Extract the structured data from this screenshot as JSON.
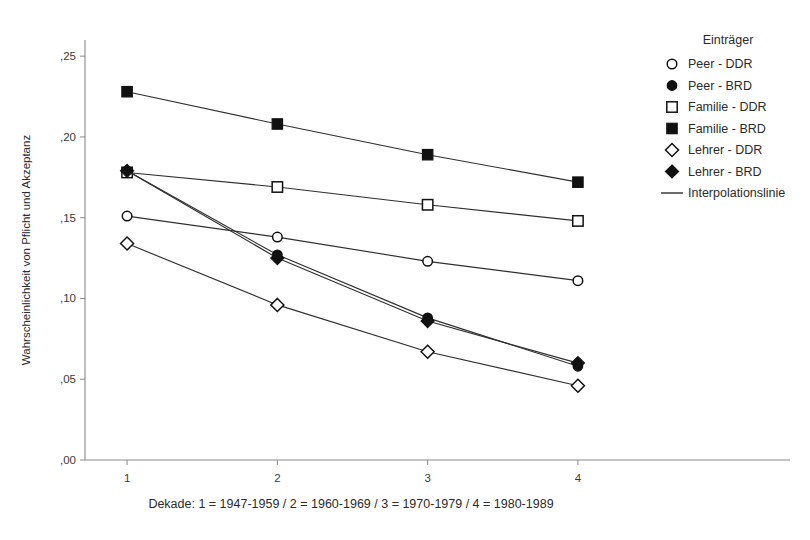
{
  "chart_data": {
    "type": "line",
    "title": "",
    "xlabel": "Dekade: 1 = 1947-1959 / 2 = 1960-1969 / 3 = 1970-1979 / 4 = 1980-1989",
    "ylabel": "Wahrscheinlichkeit von Pflicht und Akzeptanz",
    "x": [
      1,
      2,
      3,
      4
    ],
    "xtick_labels": [
      "1",
      "2",
      "3",
      "4"
    ],
    "ytick_labels": [
      ",00",
      ",05",
      ",10",
      ",15",
      ",20",
      ",25"
    ],
    "ytick_values": [
      0.0,
      0.05,
      0.1,
      0.15,
      0.2,
      0.25
    ],
    "ylim": [
      0.0,
      0.26
    ],
    "xlim": [
      0.72,
      4.28
    ],
    "grid": false,
    "legend_position": "right",
    "legend_title": "Einträger",
    "series": [
      {
        "name": "Peer - DDR",
        "marker": "circle-open",
        "values": [
          0.151,
          0.138,
          0.123,
          0.111
        ]
      },
      {
        "name": "Peer - BRD",
        "marker": "circle-filled",
        "values": [
          0.179,
          0.127,
          0.088,
          0.058
        ]
      },
      {
        "name": "Familie - DDR",
        "marker": "square-open",
        "values": [
          0.178,
          0.169,
          0.158,
          0.148
        ]
      },
      {
        "name": "Familie - BRD",
        "marker": "square-filled",
        "values": [
          0.228,
          0.208,
          0.189,
          0.172
        ]
      },
      {
        "name": "Lehrer - DDR",
        "marker": "diamond-open",
        "values": [
          0.134,
          0.096,
          0.067,
          0.046
        ]
      },
      {
        "name": "Lehrer - BRD",
        "marker": "diamond-filled",
        "values": [
          0.179,
          0.125,
          0.086,
          0.06
        ]
      }
    ],
    "extra_legend_entries": [
      {
        "name": "Interpolationslinie",
        "marker": "line"
      }
    ],
    "colors": {
      "line": "#2f2f2f",
      "marker_stroke": "#111111",
      "marker_fill_open": "#ffffff",
      "marker_fill_solid": "#111111",
      "axis": "#8a8a8a",
      "background": "#ffffff"
    }
  }
}
